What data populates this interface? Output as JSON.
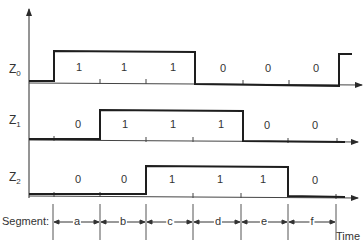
{
  "diagram": {
    "signals": [
      {
        "name": "Z",
        "subscript": "0",
        "values": [
          "1",
          "1",
          "1",
          "0",
          "0",
          "0"
        ]
      },
      {
        "name": "Z",
        "subscript": "1",
        "values": [
          "0",
          "1",
          "1",
          "1",
          "0",
          "0"
        ]
      },
      {
        "name": "Z",
        "subscript": "2",
        "values": [
          "0",
          "0",
          "1",
          "1",
          "1",
          "0"
        ]
      }
    ],
    "segment_caption": "Segment:",
    "segments": [
      "a",
      "b",
      "c",
      "d",
      "e",
      "f"
    ],
    "time_label": "Time",
    "line_color": "#2a2a2a"
  }
}
